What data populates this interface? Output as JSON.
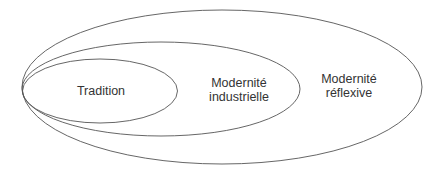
{
  "diagram": {
    "type": "nested-ellipses",
    "stroke_color": "#555555",
    "text_color": "#333333",
    "background": "#ffffff",
    "regions": [
      {
        "id": "tradition",
        "lines": [
          "Tradition"
        ]
      },
      {
        "id": "modernite-industrielle",
        "lines": [
          "Modernité",
          "industrielle"
        ]
      },
      {
        "id": "modernite-reflexive",
        "lines": [
          "Modernité",
          "réflexive"
        ]
      }
    ]
  }
}
